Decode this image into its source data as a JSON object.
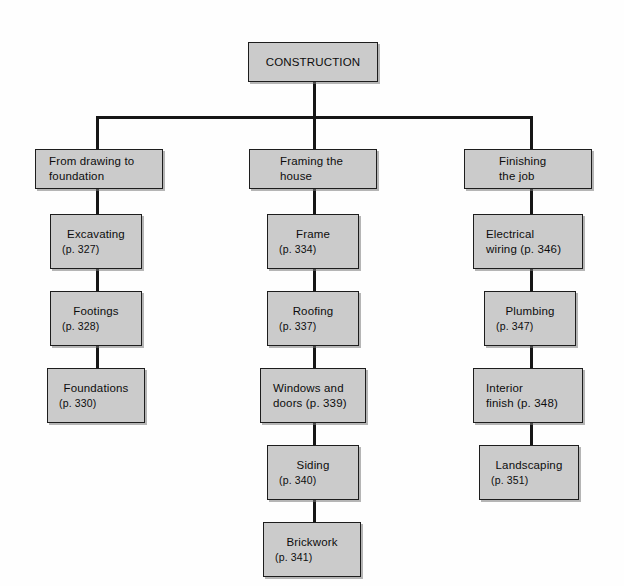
{
  "diagram": {
    "title": "CONSTRUCTION",
    "root": {
      "label": "CONSTRUCTION"
    },
    "colors": {
      "box_fill": "#cbcbcb",
      "box_border": "#1d1d1d",
      "connector": "#161616",
      "background": "#ffffff",
      "text": "#0d0d0d"
    },
    "branches": [
      {
        "heading_line1": "From drawing to",
        "heading_line2": "foundation",
        "steps": [
          {
            "name": "Excavating",
            "page": "(p. 327)",
            "layout": "stacked"
          },
          {
            "name": "Footings",
            "page": "(p. 328)",
            "layout": "stacked"
          },
          {
            "name": "Foundations",
            "page": "(p. 330)",
            "layout": "stacked"
          }
        ]
      },
      {
        "heading_line1": "Framing the",
        "heading_line2": "house",
        "steps": [
          {
            "name": "Frame",
            "page": "(p. 334)",
            "layout": "stacked"
          },
          {
            "name": "Roofing",
            "page": "(p. 337)",
            "layout": "stacked"
          },
          {
            "name": "Windows and",
            "page": "doors (p. 339)",
            "layout": "inline"
          },
          {
            "name": "Siding",
            "page": "(p. 340)",
            "layout": "stacked"
          },
          {
            "name": "Brickwork",
            "page": "(p. 341)",
            "layout": "stacked"
          }
        ]
      },
      {
        "heading_line1": "Finishing",
        "heading_line2": "the job",
        "steps": [
          {
            "name": "Electrical",
            "page": "wiring (p. 346)",
            "layout": "inline"
          },
          {
            "name": "Plumbing",
            "page": "(p. 347)",
            "layout": "stacked"
          },
          {
            "name": "Interior",
            "page": "finish (p. 348)",
            "layout": "inline"
          },
          {
            "name": "Landscaping",
            "page": "(p. 351)",
            "layout": "stacked"
          }
        ]
      }
    ]
  }
}
